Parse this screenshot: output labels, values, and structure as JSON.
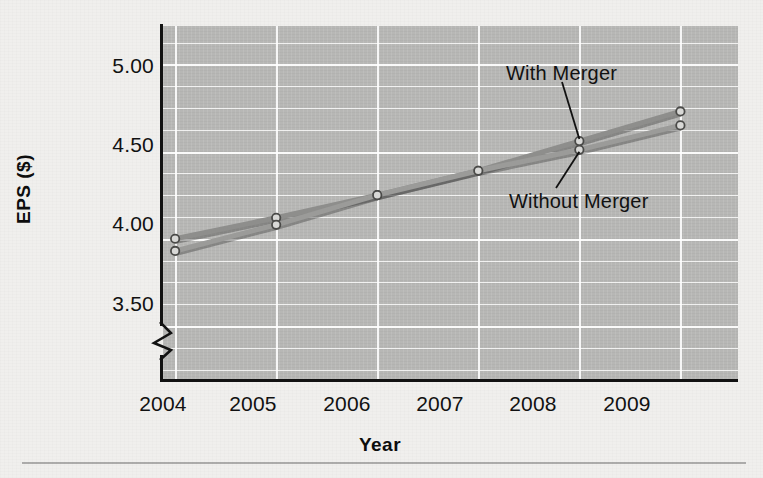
{
  "chart_data": {
    "type": "line",
    "title": "",
    "xlabel": "Year",
    "ylabel": "EPS ($)",
    "categories": [
      "2004",
      "2005",
      "2006",
      "2007",
      "2008",
      "2009"
    ],
    "x": [
      2004,
      2005,
      2006,
      2007,
      2008,
      2009
    ],
    "series": [
      {
        "name": "With Merger",
        "values": [
          4.0,
          4.12,
          4.25,
          4.39,
          4.56,
          4.73
        ],
        "color": "#8e8e8c"
      },
      {
        "name": "Without Merger",
        "values": [
          3.93,
          4.08,
          4.25,
          4.39,
          4.51,
          4.65
        ],
        "color": "#9b9b99"
      }
    ],
    "ylim": [
      3.19,
      5.22
    ],
    "xlim": [
      2003.88,
      2009.57
    ],
    "yticks": [
      3.5,
      4.0,
      4.5,
      5.0
    ],
    "ytick_labels": [
      "3.50",
      "4.00",
      "4.50",
      "5.00"
    ],
    "xtick_labels": [
      "2004",
      "2005",
      "2006",
      "2007",
      "2008",
      "2009"
    ],
    "minor_gridline_step": 0.125,
    "grid": true,
    "grid_color": "#ffffff",
    "legend_position": "inline-annotations",
    "axis_break": true,
    "axis_break_note": "zigzag break on y-axis below 3.50",
    "plot_background": "#b9b9b7",
    "page_background": "#f0efed",
    "annotations": [
      {
        "text": "With Merger",
        "points_to_series": "With Merger",
        "points_to_x": 2008,
        "points_to_y": 4.56
      },
      {
        "text": "Without Merger",
        "points_to_series": "Without Merger",
        "points_to_x": 2008,
        "points_to_y": 4.51
      }
    ]
  }
}
